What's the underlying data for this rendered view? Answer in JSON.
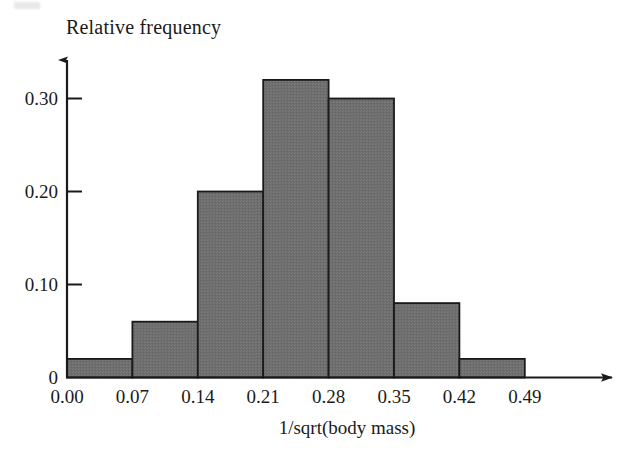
{
  "figure": {
    "scan_artifact": "top-left-smudge"
  },
  "chart_data": {
    "type": "bar",
    "title": "",
    "ylabel": "Relative frequency",
    "xlabel": "1/sqrt(body mass)",
    "categories": [
      "0.00-0.07",
      "0.07-0.14",
      "0.14-0.21",
      "0.21-0.28",
      "0.28-0.35",
      "0.35-0.42",
      "0.42-0.49"
    ],
    "bin_edges": [
      0.0,
      0.07,
      0.14,
      0.21,
      0.28,
      0.35,
      0.42,
      0.49
    ],
    "values": [
      0.02,
      0.06,
      0.2,
      0.32,
      0.3,
      0.08,
      0.02
    ],
    "xticks": [
      "0.00",
      "0.07",
      "0.14",
      "0.21",
      "0.28",
      "0.35",
      "0.42",
      "0.49"
    ],
    "xtick_values": [
      0.0,
      0.07,
      0.14,
      0.21,
      0.28,
      0.35,
      0.42,
      0.49
    ],
    "yticks": [
      "0",
      "0.10",
      "0.20",
      "0.30"
    ],
    "ytick_values": [
      0,
      0.1,
      0.2,
      0.3
    ],
    "xlim": [
      0.0,
      0.553
    ],
    "ylim": [
      0.0,
      0.35
    ],
    "grid": false,
    "legend": false,
    "bar_fill_color": "#6e6e6e",
    "bar_edge_color": "#1a1a1a",
    "axis_color": "#1a1a1a",
    "axis_arrows": true
  }
}
